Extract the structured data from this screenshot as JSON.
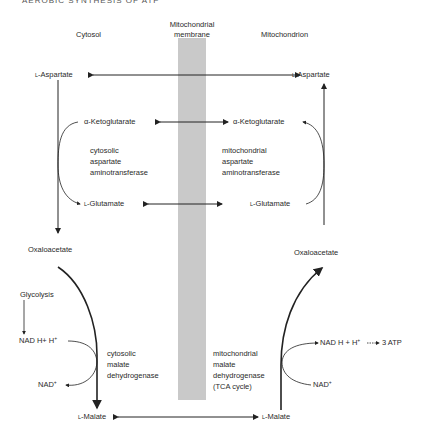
{
  "title": "AEROBIC SYNTHESIS OF ATP",
  "headers": {
    "cytosol": "Cytosol",
    "membrane_line1": "Mitochondrial",
    "membrane_line2": "membrane",
    "mitochondrion": "Mitochondrion"
  },
  "cytosol": {
    "aspartate": "-Aspartate",
    "aspartate_prefix": "L",
    "ketoglutarate": "α-Ketoglutarate",
    "glutamate": "-Glutamate",
    "glutamate_prefix": "L",
    "enzyme_aat": [
      "cytosolic",
      "aspartate",
      "aminotransferase"
    ],
    "oxaloacetate": "Oxaloacetate",
    "glycolysis": "Glycolysis",
    "nadh": "NAD H+  H",
    "nadh_sup": "+",
    "nad": "NAD",
    "nad_sup": "+",
    "enzyme_mdh": [
      "cytosolic",
      "malate",
      "dehydrogenase"
    ],
    "malate": "-Malate",
    "malate_prefix": "L"
  },
  "mitochondrion": {
    "aspartate": "-Aspartate",
    "aspartate_prefix": "L",
    "ketoglutarate": "α-Ketoglutarate",
    "glutamate": "-Glutamate",
    "glutamate_prefix": "L",
    "enzyme_aat": [
      "mitochondrial",
      "aspartate",
      "aminotransferase"
    ],
    "oxaloacetate": "Oxaloacetate",
    "nadh": "NAD H + H",
    "nadh_sup": "+",
    "atp": "3  ATP",
    "nad": "NAD",
    "nad_sup": "+",
    "enzyme_mdh": [
      "mitochondrial",
      "malate",
      "dehydrogenase",
      "(TCA cycle)"
    ],
    "malate": "-Malate",
    "malate_prefix": "L"
  },
  "colors": {
    "membrane": "#c9c9c9",
    "line": "#222222",
    "text": "#2a2a2a"
  }
}
